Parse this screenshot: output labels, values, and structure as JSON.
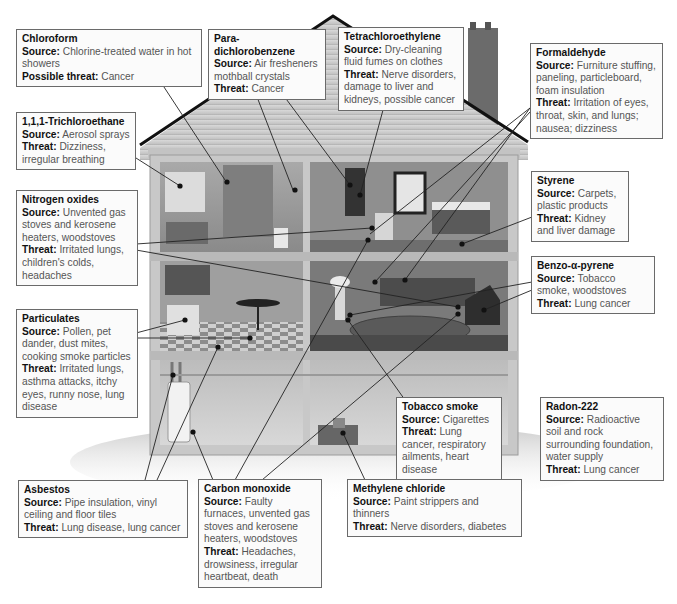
{
  "diagram": {
    "callouts": [
      {
        "id": "chloroform",
        "title": "Chloroform",
        "lines": [
          {
            "label": "Source:",
            "text": "Chlorine-treated water in hot showers"
          },
          {
            "label": "Possible threat:",
            "text": "Cancer"
          }
        ]
      },
      {
        "id": "para-dichlorobenzene",
        "title": "Para-dichlorobenzene",
        "lines": [
          {
            "label": "Source:",
            "text": "Air fresheners mothball crystals"
          },
          {
            "label": "Threat:",
            "text": "Cancer"
          }
        ]
      },
      {
        "id": "tetrachloroethylene",
        "title": "Tetrachloroethylene",
        "lines": [
          {
            "label": "Source:",
            "text": "Dry-cleaning fluid fumes on clothes"
          },
          {
            "label": "Threat:",
            "text": "Nerve disorders, damage to liver and kidneys, possible cancer"
          }
        ]
      },
      {
        "id": "formaldehyde",
        "title": "Formaldehyde",
        "lines": [
          {
            "label": "Source:",
            "text": "Furniture stuffing, paneling, particleboard, foam insulation"
          },
          {
            "label": "Threat:",
            "text": "Irritation of eyes, throat, skin, and lungs; nausea; dizziness"
          }
        ]
      },
      {
        "id": "trichloroethane",
        "title": "1,1,1-Trichloroethane",
        "lines": [
          {
            "label": "Source:",
            "text": "Aerosol sprays"
          },
          {
            "label": "Threat:",
            "text": "Dizziness, irregular breathing"
          }
        ]
      },
      {
        "id": "styrene",
        "title": "Styrene",
        "lines": [
          {
            "label": "Source:",
            "text": "Carpets, plastic products"
          },
          {
            "label": "Threat:",
            "text": "Kidney and liver damage"
          }
        ]
      },
      {
        "id": "nitrogen-oxides",
        "title": "Nitrogen oxides",
        "lines": [
          {
            "label": "Source:",
            "text": "Unvented gas stoves and kerosene heaters, woodstoves"
          },
          {
            "label": "Threat:",
            "text": "Irritated lungs, children's colds, headaches"
          }
        ]
      },
      {
        "id": "benzo-a-pyrene",
        "title": "Benzo-α-pyrene",
        "lines": [
          {
            "label": "Source:",
            "text": "Tobacco smoke, woodstoves"
          },
          {
            "label": "Threat:",
            "text": "Lung cancer"
          }
        ]
      },
      {
        "id": "particulates",
        "title": "Particulates",
        "lines": [
          {
            "label": "Source:",
            "text": "Pollen, pet dander, dust mites, cooking smoke particles"
          },
          {
            "label": "Threat:",
            "text": "Irritated lungs, asthma attacks, itchy eyes, runny nose, lung disease"
          }
        ]
      },
      {
        "id": "tobacco-smoke",
        "title": "Tobacco smoke",
        "lines": [
          {
            "label": "Source:",
            "text": "Cigarettes"
          },
          {
            "label": "Threat:",
            "text": "Lung cancer, respiratory ailments, heart disease"
          }
        ]
      },
      {
        "id": "radon-222",
        "title": "Radon-222",
        "lines": [
          {
            "label": "Source:",
            "text": "Radioactive soil and rock surrounding foundation, water supply"
          },
          {
            "label": "Threat:",
            "text": "Lung cancer"
          }
        ]
      },
      {
        "id": "asbestos",
        "title": "Asbestos",
        "lines": [
          {
            "label": "Source:",
            "text": "Pipe insulation, vinyl ceiling and floor tiles"
          },
          {
            "label": "Threat:",
            "text": "Lung disease, lung cancer"
          }
        ]
      },
      {
        "id": "carbon-monoxide",
        "title": "Carbon monoxide",
        "lines": [
          {
            "label": "Source:",
            "text": "Faulty furnaces, unvented gas stoves and kerosene heaters, woodstoves"
          },
          {
            "label": "Threat:",
            "text": "Headaches, drowsiness, irregular heartbeat, death"
          }
        ]
      },
      {
        "id": "methylene-chloride",
        "title": "Methylene chloride",
        "lines": [
          {
            "label": "Source:",
            "text": "Paint strippers and thinners"
          },
          {
            "label": "Threat:",
            "text": "Nerve disorders, diabetes"
          }
        ]
      }
    ],
    "colors": {
      "box_border": "#6a6a6a",
      "box_fill": "#fbfbfb",
      "title_text": "#111111",
      "body_text": "#555555",
      "leader_line": "#222222",
      "house_wall": "#c9c9c9",
      "roof": "#cfcfcf",
      "room_fill": "#9a9a9a",
      "chimney": "#6b6b6b"
    }
  }
}
